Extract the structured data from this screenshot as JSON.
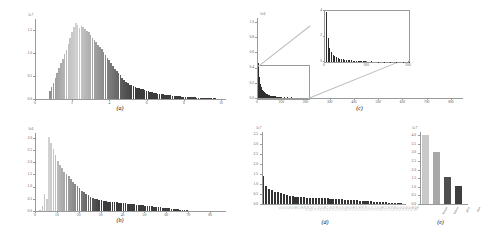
{
  "figure": {
    "panels": [
      "a",
      "b",
      "c",
      "d",
      "e"
    ]
  },
  "captions": {
    "a": "(a)",
    "b": "(b)",
    "c": "(c)",
    "d": "(d)",
    "e": "(e)"
  },
  "chart_data": [
    {
      "id": "a",
      "type": "bar",
      "title": "",
      "xlabel": "",
      "ylabel": "",
      "y_offset_text": "1e7",
      "xlim": [
        0,
        10
      ],
      "ylim": [
        0,
        1.75
      ],
      "grid": false,
      "legend": null,
      "xticks": [
        0,
        2,
        4,
        6,
        8,
        10
      ],
      "xticklabels": [
        "0",
        "2",
        "4",
        "6",
        "8",
        "10"
      ],
      "yticks": [
        0.0,
        0.5,
        1.0,
        1.5
      ],
      "yticklabels": [
        "0.0",
        "0.5",
        "1.0",
        "1.5"
      ],
      "x": [
        0.75,
        0.85,
        0.95,
        1.05,
        1.15,
        1.25,
        1.35,
        1.45,
        1.55,
        1.65,
        1.75,
        1.85,
        1.95,
        2.05,
        2.15,
        2.25,
        2.35,
        2.45,
        2.55,
        2.65,
        2.75,
        2.85,
        2.95,
        3.05,
        3.15,
        3.25,
        3.35,
        3.45,
        3.55,
        3.65,
        3.75,
        3.85,
        3.95,
        4.05,
        4.15,
        4.25,
        4.35,
        4.45,
        4.55,
        4.65,
        4.75,
        4.85,
        4.95,
        5.05,
        5.15,
        5.25,
        5.35,
        5.45,
        5.55,
        5.65,
        5.75,
        5.85,
        5.95,
        6.05,
        6.15,
        6.25,
        6.35,
        6.45,
        6.55,
        6.65,
        6.75,
        6.85,
        6.95,
        7.05,
        7.15,
        7.25,
        7.35,
        7.45,
        7.55,
        7.65,
        7.75,
        7.85,
        7.95,
        8.05,
        8.15,
        8.25,
        8.35,
        8.45,
        8.55,
        8.65,
        8.75,
        8.85,
        8.95,
        9.05,
        9.15,
        9.25,
        9.35,
        9.45,
        9.55,
        9.65
      ],
      "values": [
        0.18,
        0.26,
        0.34,
        0.46,
        0.58,
        0.68,
        0.78,
        0.88,
        0.98,
        1.08,
        1.2,
        1.34,
        1.46,
        1.58,
        1.66,
        1.62,
        1.56,
        1.6,
        1.58,
        1.54,
        1.48,
        1.46,
        1.4,
        1.34,
        1.3,
        1.24,
        1.18,
        1.14,
        1.1,
        1.02,
        0.96,
        0.9,
        0.86,
        0.78,
        0.72,
        0.66,
        0.62,
        0.56,
        0.52,
        0.46,
        0.42,
        0.38,
        0.35,
        0.31,
        0.3,
        0.28,
        0.26,
        0.25,
        0.24,
        0.23,
        0.21,
        0.2,
        0.18,
        0.17,
        0.16,
        0.15,
        0.14,
        0.13,
        0.12,
        0.115,
        0.11,
        0.1,
        0.095,
        0.09,
        0.085,
        0.08,
        0.075,
        0.07,
        0.065,
        0.06,
        0.058,
        0.055,
        0.05,
        0.048,
        0.045,
        0.042,
        0.04,
        0.038,
        0.035,
        0.033,
        0.03,
        0.028,
        0.026,
        0.024,
        0.022,
        0.02,
        0.018,
        0.016,
        0.014,
        0.012
      ]
    },
    {
      "id": "b",
      "type": "bar",
      "title": "",
      "xlabel": "",
      "ylabel": "",
      "y_offset_text": "1e6",
      "xlim": [
        0,
        85
      ],
      "ylim": [
        0,
        3.2
      ],
      "grid": false,
      "legend": null,
      "xticks": [
        0,
        10,
        20,
        30,
        40,
        50,
        60,
        70,
        80
      ],
      "xticklabels": [
        "0",
        "10",
        "20",
        "30",
        "40",
        "50",
        "60",
        "70",
        "80"
      ],
      "yticks": [
        0.0,
        0.5,
        1.0,
        1.5,
        2.0,
        2.5,
        3.0
      ],
      "yticklabels": [
        "0.0",
        "0.5",
        "1.0",
        "1.5",
        "2.0",
        "2.5",
        "3.0"
      ],
      "x": [
        2,
        3,
        4,
        5,
        6,
        7,
        8,
        9,
        10,
        11,
        12,
        13,
        14,
        15,
        16,
        17,
        18,
        19,
        20,
        21,
        22,
        23,
        24,
        25,
        26,
        27,
        28,
        29,
        30,
        31,
        32,
        33,
        34,
        35,
        36,
        37,
        38,
        39,
        40,
        41,
        42,
        43,
        44,
        45,
        46,
        47,
        48,
        49,
        50,
        51,
        52,
        53,
        54,
        55,
        56,
        57,
        58,
        59,
        60,
        61,
        62,
        63,
        64,
        65,
        66,
        67,
        68,
        69,
        70
      ],
      "values": [
        0.06,
        0.22,
        0.7,
        0.5,
        3.05,
        2.8,
        2.55,
        2.3,
        2.05,
        1.9,
        1.75,
        1.62,
        1.52,
        1.45,
        1.3,
        1.2,
        1.1,
        1.02,
        0.95,
        0.84,
        0.76,
        0.7,
        0.64,
        0.58,
        0.52,
        0.5,
        0.48,
        0.46,
        0.44,
        0.42,
        0.4,
        0.39,
        0.38,
        0.37,
        0.36,
        0.35,
        0.34,
        0.33,
        0.32,
        0.31,
        0.3,
        0.29,
        0.28,
        0.27,
        0.26,
        0.25,
        0.24,
        0.23,
        0.22,
        0.21,
        0.2,
        0.19,
        0.18,
        0.17,
        0.16,
        0.15,
        0.14,
        0.13,
        0.12,
        0.11,
        0.1,
        0.09,
        0.08,
        0.07,
        0.06,
        0.05,
        0.04,
        0.03,
        0.02
      ]
    },
    {
      "id": "c",
      "type": "bar",
      "title": "",
      "xlabel": "",
      "ylabel": "",
      "y_offset_text": "1e6",
      "xlim": [
        0,
        850
      ],
      "ylim": [
        0,
        1.05
      ],
      "grid": false,
      "legend": null,
      "xticks": [
        0,
        100,
        200,
        300,
        400,
        500,
        600,
        700,
        800
      ],
      "xticklabels": [
        "0",
        "100",
        "200",
        "300",
        "400",
        "500",
        "600",
        "700",
        "800"
      ],
      "yticks": [
        0.0,
        0.2,
        0.4,
        0.6,
        0.8,
        1.0
      ],
      "yticklabels": [
        "0.0",
        "0.2",
        "0.4",
        "0.6",
        "0.8",
        "1.0"
      ],
      "x": [
        2,
        6,
        10,
        14,
        18,
        22,
        26,
        30,
        34,
        38,
        42,
        46,
        50,
        54,
        58,
        62,
        66,
        70,
        74,
        78,
        82,
        86,
        90,
        94,
        98,
        110,
        125,
        140,
        155,
        170,
        185,
        200
      ],
      "values": [
        0.98,
        0.46,
        0.28,
        0.19,
        0.14,
        0.11,
        0.09,
        0.075,
        0.064,
        0.055,
        0.048,
        0.042,
        0.037,
        0.033,
        0.03,
        0.027,
        0.024,
        0.022,
        0.02,
        0.018,
        0.017,
        0.015,
        0.014,
        0.013,
        0.012,
        0.01,
        0.008,
        0.007,
        0.006,
        0.005,
        0.004,
        0.003
      ],
      "inset": {
        "xlim": [
          0,
          200
        ],
        "ylim": [
          0,
          4
        ],
        "xticks": [
          0,
          100,
          200
        ],
        "xticklabels": [
          "0",
          "100",
          "200"
        ],
        "yticks": [
          0,
          2,
          4
        ],
        "yticklabels": [
          "0",
          "2",
          "4"
        ],
        "x": [
          2,
          6,
          10,
          14,
          18,
          22,
          26,
          30,
          34,
          38,
          42,
          46,
          50,
          54,
          58,
          62,
          66,
          70,
          74,
          78,
          82,
          86,
          90,
          94,
          98,
          110,
          125,
          140,
          155,
          170,
          185,
          200
        ],
        "values": [
          3.95,
          1.85,
          1.1,
          0.78,
          0.58,
          0.45,
          0.37,
          0.31,
          0.26,
          0.23,
          0.2,
          0.18,
          0.16,
          0.14,
          0.13,
          0.12,
          0.11,
          0.1,
          0.09,
          0.08,
          0.075,
          0.07,
          0.065,
          0.06,
          0.055,
          0.046,
          0.038,
          0.032,
          0.027,
          0.023,
          0.019,
          0.015
        ]
      }
    },
    {
      "id": "d",
      "type": "bar",
      "title": "",
      "xlabel": "",
      "ylabel": "",
      "y_offset_text": "1e7",
      "ylim": [
        0,
        3.6
      ],
      "grid": false,
      "legend": null,
      "yticks": [
        0.0,
        0.5,
        1.0,
        1.5,
        2.0,
        2.5,
        3.0,
        3.5
      ],
      "yticklabels": [
        "0.0",
        "0.5",
        "1.0",
        "1.5",
        "2.0",
        "2.5",
        "3.0",
        "3.5"
      ],
      "categories": [
        "C1",
        "C2",
        "C3",
        "C4",
        "C5",
        "C6",
        "C7",
        "C8",
        "C9",
        "C10",
        "C11",
        "C12",
        "C13",
        "C14",
        "C15",
        "C16",
        "C17",
        "C18",
        "C19",
        "C20",
        "C21",
        "C22",
        "C23",
        "C24",
        "C25",
        "C26",
        "C27",
        "C28",
        "C29",
        "C30",
        "C31",
        "C32",
        "C33",
        "C34",
        "C35",
        "C36",
        "C37",
        "C38",
        "C39",
        "C40",
        "C41",
        "C42",
        "C43",
        "C44",
        "C45",
        "C46",
        "C47",
        "C48"
      ],
      "values": [
        1.42,
        0.92,
        0.74,
        0.68,
        0.62,
        0.58,
        0.54,
        0.5,
        0.46,
        0.4,
        0.38,
        0.36,
        0.35,
        0.34,
        0.33,
        0.32,
        0.32,
        0.31,
        0.31,
        0.3,
        0.3,
        0.29,
        0.28,
        0.27,
        0.26,
        0.25,
        0.24,
        0.23,
        0.22,
        0.21,
        0.2,
        0.19,
        0.18,
        0.17,
        0.16,
        0.15,
        0.14,
        0.13,
        0.12,
        0.11,
        0.1,
        0.09,
        0.08,
        0.07,
        0.06,
        0.05,
        0.04,
        0.03
      ]
    },
    {
      "id": "e",
      "type": "bar",
      "title": "",
      "xlabel": "",
      "ylabel": "",
      "y_offset_text": "1e7",
      "ylim": [
        0,
        4.2
      ],
      "grid": false,
      "legend": null,
      "yticks": [
        0.0,
        0.5,
        1.0,
        1.5,
        2.0,
        2.5,
        3.0,
        3.5,
        4.0
      ],
      "yticklabels": [
        "0.0",
        "0.5",
        "1.0",
        "1.5",
        "2.0",
        "2.5",
        "3.0",
        "3.5",
        "4.0"
      ],
      "categories": [
        "bronze",
        "indoor",
        "grey",
        "blue"
      ],
      "values": [
        4.05,
        3.05,
        1.55,
        1.05
      ],
      "colors": [
        "#c9c9c9",
        "#a8a8a8",
        "#4f4f4f",
        "#3f3f3f"
      ]
    }
  ]
}
